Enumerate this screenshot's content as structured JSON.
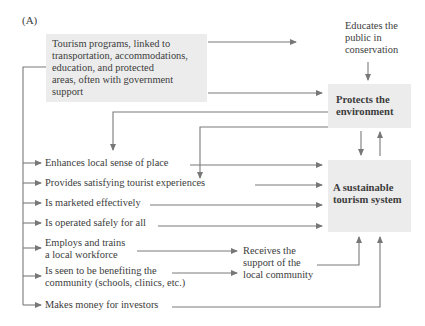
{
  "figure": {
    "panel_label": "(A)",
    "colors": {
      "box_fill": "#ececec",
      "line": "#777777",
      "text": "#3c3c3c"
    },
    "source_box": {
      "lines": [
        "Tourism programs, linked to",
        "transportation, accommodations,",
        "education, and protected",
        "areas, often with government",
        "support"
      ]
    },
    "educates": {
      "lines": [
        "Educates the",
        "public in",
        "conservation"
      ]
    },
    "protects": {
      "lines": [
        "Protects the",
        "environment"
      ]
    },
    "sustainable": {
      "lines": [
        "A sustainable",
        "tourism system"
      ]
    },
    "receives": {
      "lines": [
        "Receives the",
        "support of the",
        "local community"
      ]
    },
    "outcomes": [
      {
        "lines": [
          "Enhances local sense of place"
        ]
      },
      {
        "lines": [
          "Provides satisfying tourist experiences"
        ]
      },
      {
        "lines": [
          "Is marketed effectively"
        ]
      },
      {
        "lines": [
          "Is operated safely for all"
        ]
      },
      {
        "lines": [
          "Employs and trains",
          "a local workforce"
        ]
      },
      {
        "lines": [
          "Is seen to be benefiting the",
          "community (schools, clinics, etc.)"
        ]
      },
      {
        "lines": [
          "Makes money for investors"
        ]
      }
    ]
  }
}
